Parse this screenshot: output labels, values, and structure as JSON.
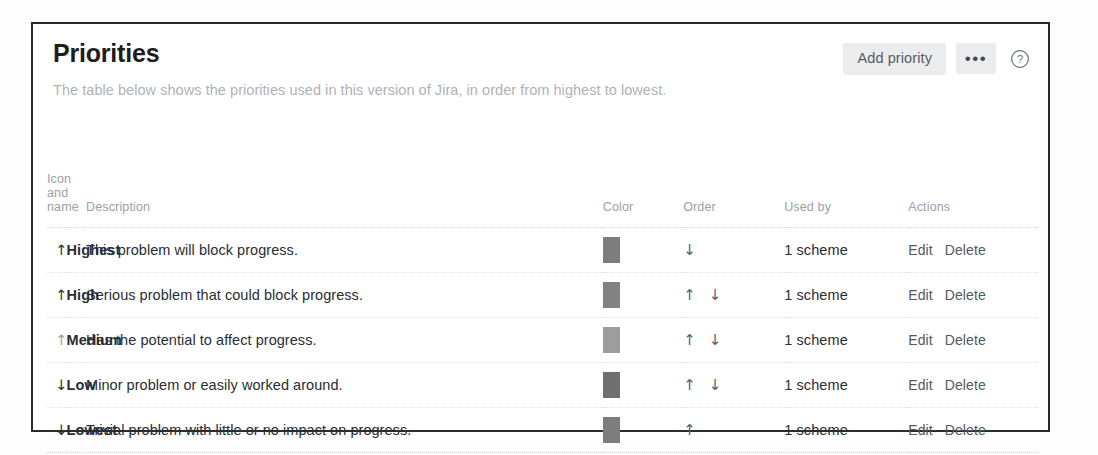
{
  "card": {
    "title": "Priorities",
    "description": "The table below shows the priorities used in this version of Jira, in order from highest to lowest.",
    "actions": {
      "add_priority_label": "Add priority",
      "more_label": "•••",
      "help_label": "?"
    }
  },
  "table": {
    "headers": {
      "icon_and_name": "Icon and name",
      "description": "Description",
      "color": "Color",
      "order": "Order",
      "used_by": "Used by",
      "actions": "Actions"
    },
    "rows": [
      {
        "icon": "↑",
        "icon_direction": "up",
        "name": "Highest",
        "description": "This problem will block progress.",
        "color": "#7d7d7d",
        "order_up": "",
        "order_down": "↓",
        "used_by": "1 scheme",
        "edit_label": "Edit",
        "delete_label": "Delete"
      },
      {
        "icon": "↑",
        "icon_direction": "up",
        "name": "High",
        "description": "Serious problem that could block progress.",
        "color": "#828282",
        "order_up": "↑",
        "order_down": "↓",
        "used_by": "1 scheme",
        "edit_label": "Edit",
        "delete_label": "Delete"
      },
      {
        "icon": "↑",
        "icon_direction": "up",
        "name": "Medium",
        "description": "Has the potential to affect progress.",
        "color": "#9d9d9d",
        "order_up": "↑",
        "order_down": "↓",
        "used_by": "1 scheme",
        "edit_label": "Edit",
        "delete_label": "Delete"
      },
      {
        "icon": "↓",
        "icon_direction": "down",
        "name": "Low",
        "description": "Minor problem or easily worked around.",
        "color": "#6f6f6f",
        "order_up": "↑",
        "order_down": "↓",
        "used_by": "1 scheme",
        "edit_label": "Edit",
        "delete_label": "Delete"
      },
      {
        "icon": "↓",
        "icon_direction": "down",
        "name": "Lowest",
        "description": "Trivial problem with little or no impact on progress.",
        "color": "#7d7d7d",
        "order_up": "↑",
        "order_down": "",
        "used_by": "1 scheme",
        "edit_label": "Edit",
        "delete_label": "Delete"
      }
    ]
  }
}
